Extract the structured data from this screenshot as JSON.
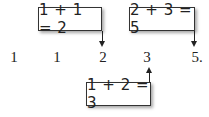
{
  "diagram": {
    "sequence": [
      "1",
      "1",
      "2",
      "3",
      "5."
    ],
    "boxes": [
      {
        "label": "1 + 1 = 2",
        "points_to": "2"
      },
      {
        "label": "2 + 3 = 5",
        "points_to": "5."
      },
      {
        "label": "1 + 2 = 3",
        "points_to": "3"
      }
    ],
    "colors": {
      "line": "#222222",
      "text": "#222222",
      "background": "#ffffff"
    }
  }
}
